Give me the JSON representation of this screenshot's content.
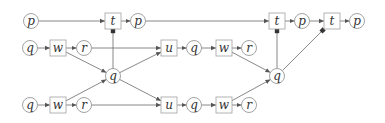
{
  "diagram": {
    "colors": {
      "edge": "#6a6a6a",
      "circle_border": "#8a8a8a",
      "box_border": "#a0a0a0",
      "text": "#333333",
      "background": "#ffffff"
    },
    "nodes": [
      {
        "id": "p1",
        "label": "p",
        "shape": "circle",
        "x": 31,
        "y": 21
      },
      {
        "id": "t1",
        "label": "t",
        "shape": "box",
        "x": 113,
        "y": 21
      },
      {
        "id": "p2",
        "label": "p",
        "shape": "circle",
        "x": 138,
        "y": 21
      },
      {
        "id": "t2",
        "label": "t",
        "shape": "box",
        "x": 277,
        "y": 21
      },
      {
        "id": "p3",
        "label": "p",
        "shape": "circle",
        "x": 302,
        "y": 21
      },
      {
        "id": "t3",
        "label": "t",
        "shape": "box",
        "x": 332,
        "y": 21
      },
      {
        "id": "p4",
        "label": "p",
        "shape": "circle",
        "x": 357,
        "y": 21
      },
      {
        "id": "q1",
        "label": "q",
        "shape": "circle",
        "x": 30,
        "y": 48
      },
      {
        "id": "w1",
        "label": "w",
        "shape": "box",
        "x": 58,
        "y": 48
      },
      {
        "id": "r1",
        "label": "r",
        "shape": "circle",
        "x": 84,
        "y": 48
      },
      {
        "id": "u1",
        "label": "u",
        "shape": "box",
        "x": 169,
        "y": 48
      },
      {
        "id": "q2",
        "label": "q",
        "shape": "circle",
        "x": 194,
        "y": 48
      },
      {
        "id": "w2",
        "label": "w",
        "shape": "box",
        "x": 224,
        "y": 48
      },
      {
        "id": "r2",
        "label": "r",
        "shape": "circle",
        "x": 249,
        "y": 48
      },
      {
        "id": "qm1",
        "label": "q",
        "shape": "circle",
        "x": 113,
        "y": 76
      },
      {
        "id": "qm2",
        "label": "q",
        "shape": "circle",
        "x": 277,
        "y": 76
      },
      {
        "id": "q3",
        "label": "q",
        "shape": "circle",
        "x": 30,
        "y": 105
      },
      {
        "id": "w3",
        "label": "w",
        "shape": "box",
        "x": 58,
        "y": 105
      },
      {
        "id": "r3",
        "label": "r",
        "shape": "circle",
        "x": 84,
        "y": 105
      },
      {
        "id": "u2",
        "label": "u",
        "shape": "box",
        "x": 169,
        "y": 105
      },
      {
        "id": "q4",
        "label": "q",
        "shape": "circle",
        "x": 194,
        "y": 105
      },
      {
        "id": "w4",
        "label": "w",
        "shape": "box",
        "x": 224,
        "y": 105
      },
      {
        "id": "r4",
        "label": "r",
        "shape": "circle",
        "x": 249,
        "y": 105
      }
    ],
    "edges": [
      {
        "from": "p1",
        "to": "t1",
        "type": "arrow"
      },
      {
        "from": "t1",
        "to": "p2",
        "type": "arrow"
      },
      {
        "from": "p2",
        "to": "t2",
        "type": "arrow"
      },
      {
        "from": "t2",
        "to": "p3",
        "type": "arrow"
      },
      {
        "from": "p3",
        "to": "t3",
        "type": "arrow"
      },
      {
        "from": "t3",
        "to": "p4",
        "type": "arrow"
      },
      {
        "from": "q1",
        "to": "w1",
        "type": "arrow"
      },
      {
        "from": "w1",
        "to": "r1",
        "type": "arrow"
      },
      {
        "from": "r1",
        "to": "u1",
        "type": "arrow"
      },
      {
        "from": "w1",
        "to": "qm1",
        "type": "arrow"
      },
      {
        "from": "u1",
        "to": "q2",
        "type": "arrow"
      },
      {
        "from": "q2",
        "to": "w2",
        "type": "arrow"
      },
      {
        "from": "w2",
        "to": "r2",
        "type": "arrow"
      },
      {
        "from": "w2",
        "to": "qm2",
        "type": "arrow"
      },
      {
        "from": "q3",
        "to": "w3",
        "type": "arrow"
      },
      {
        "from": "w3",
        "to": "r3",
        "type": "arrow"
      },
      {
        "from": "r3",
        "to": "u2",
        "type": "arrow"
      },
      {
        "from": "w3",
        "to": "qm1",
        "type": "arrow"
      },
      {
        "from": "qm1",
        "to": "u1",
        "type": "arrow"
      },
      {
        "from": "qm1",
        "to": "u2",
        "type": "arrow"
      },
      {
        "from": "u2",
        "to": "q4",
        "type": "arrow"
      },
      {
        "from": "q4",
        "to": "w4",
        "type": "arrow"
      },
      {
        "from": "w4",
        "to": "r4",
        "type": "arrow"
      },
      {
        "from": "w4",
        "to": "qm2",
        "type": "arrow"
      },
      {
        "from": "qm1",
        "to": "t1",
        "type": "dot"
      },
      {
        "from": "qm2",
        "to": "t2",
        "type": "dot"
      },
      {
        "from": "qm2",
        "to": "t3",
        "type": "dot"
      }
    ]
  }
}
